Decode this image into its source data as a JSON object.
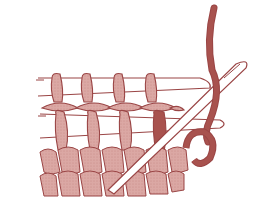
{
  "illustration": {
    "subject": "Grafting knit stitches with a tapestry needle",
    "text_labels": [],
    "colors": {
      "background": "#ffffff",
      "yarn_fill": "#d7a09c",
      "yarn_dark_fill": "#a8524e",
      "outline": "#9a4545",
      "needle_fill": "#ffffff"
    },
    "elements": {
      "upper_live_stitches": 4,
      "lower_live_stitches": 4,
      "knit_fabric_rows": 2,
      "needle": "tapestry-needle",
      "working_yarn": "yarn-tail"
    }
  }
}
